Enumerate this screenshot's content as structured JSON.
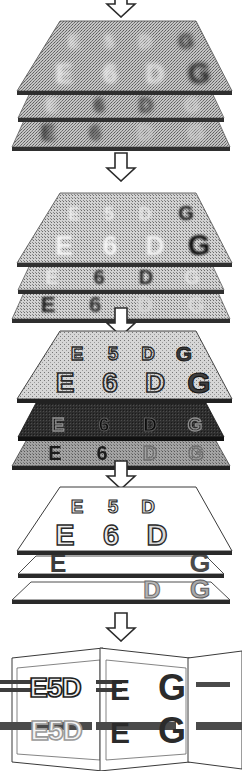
{
  "figure": {
    "type": "diagram",
    "width": 242,
    "height": 771,
    "background": "#ffffff",
    "stages": [
      {
        "id": "stage-1",
        "name": "noisy-stack",
        "order": 1,
        "description": "Three stacked horizontal planes, heavily noisy/dithered mid-gray, characters barely visible",
        "plane_fill": "#b9b9b9",
        "plane_edge": "#555555",
        "noise": "heavy",
        "sheets": [
          {
            "name": "sheet-top",
            "fill": "#b5b5b5",
            "characters_row_small": [
              "E",
              "5",
              "D",
              "G"
            ],
            "characters_row_large": [
              "E",
              "6",
              "D",
              "G"
            ]
          },
          {
            "name": "sheet-middle",
            "fill": "#b5b5b5",
            "characters_row_small": [
              "E",
              "5",
              "D",
              "G"
            ],
            "characters_row_large": [
              "E",
              "6",
              "D",
              "G"
            ]
          },
          {
            "name": "sheet-bottom",
            "fill": "#b5b5b5",
            "characters_row_small": [
              "E",
              "5",
              "D",
              "G"
            ],
            "characters_row_large": [
              "E",
              "6",
              "D",
              "G"
            ]
          }
        ]
      },
      {
        "id": "stage-2",
        "name": "less-noisy-stack",
        "order": 2,
        "description": "Three stacked planes, noise reduced, characters E 5 D G / E 6 D G becoming legible",
        "plane_fill": "#c2c2c2",
        "plane_edge": "#555555",
        "noise": "medium",
        "sheets": [
          {
            "name": "sheet-top",
            "fill": "#c0c0c0",
            "characters_row_small": [
              "E",
              "5",
              "D",
              "G"
            ],
            "characters_row_large": [
              "E",
              "6",
              "D",
              "G"
            ]
          },
          {
            "name": "sheet-middle",
            "fill": "#c0c0c0",
            "characters_row_small": [
              "E",
              "5",
              "D",
              "G"
            ],
            "characters_row_large": [
              "E",
              "6",
              "D",
              "G"
            ]
          },
          {
            "name": "sheet-bottom",
            "fill": "#c0c0c0",
            "characters_row_small": [
              "E",
              "5",
              "D",
              "G"
            ],
            "characters_row_large": [
              "E",
              "6",
              "D",
              "G"
            ]
          }
        ]
      },
      {
        "id": "stage-3",
        "name": "outlined-stack",
        "order": 3,
        "description": "Three stacked planes; top plane light gray with clearly outlined E 5 D G / E 6 D G, middle plane very dark, bottom plane mid-gray",
        "plane_fill": "#c8c8c8",
        "plane_edge": "#444444",
        "noise": "light",
        "sheets": [
          {
            "name": "sheet-top",
            "fill": "#c8c8c8",
            "characters_row_small": [
              "E",
              "5",
              "D",
              "G"
            ],
            "characters_row_large": [
              "E",
              "6",
              "D",
              "G"
            ]
          },
          {
            "name": "sheet-middle",
            "fill": "#333333",
            "characters_row_small": [
              "E",
              "5",
              "D",
              "G"
            ],
            "characters_row_large": [
              "E",
              "6",
              "D",
              "G"
            ]
          },
          {
            "name": "sheet-bottom",
            "fill": "#9a9a9a",
            "characters_row_small": [
              "E",
              "5",
              "D",
              "G"
            ],
            "characters_row_large": [
              "E",
              "6",
              "D",
              "G"
            ]
          }
        ]
      },
      {
        "id": "stage-4",
        "name": "clean-stack",
        "order": 4,
        "description": "Three stacked white planes; top holds clean E 5 D and E 6 D, lower sheets hold E ... G and D G",
        "plane_fill": "#ffffff",
        "plane_edge": "#333333",
        "noise": "none",
        "sheets": [
          {
            "name": "sheet-top",
            "fill": "#ffffff",
            "characters_row_small": [
              "E",
              "5",
              "D"
            ],
            "characters_row_large": [
              "E",
              "6",
              "D"
            ]
          },
          {
            "name": "sheet-middle",
            "fill": "#ffffff",
            "characters_row_small": [
              "E",
              "G"
            ],
            "characters_row_large": [
              "E",
              "G"
            ]
          },
          {
            "name": "sheet-bottom",
            "fill": "#ffffff",
            "characters_row_small": [
              "D",
              "G"
            ],
            "characters_row_large": [
              "D",
              "G"
            ]
          }
        ]
      },
      {
        "id": "stage-5",
        "name": "perspective-planes",
        "order": 5,
        "description": "Three vertical planes seen in perspective, each carrying characters pierced by horizontal bars",
        "plane_fill": "#ffffff",
        "plane_edge": "#333333",
        "bar_color": "#4a4a4a",
        "panes": [
          {
            "name": "pane-left",
            "characters_upper": "E5D",
            "characters_lower": "E5D",
            "upper_style": "outlined",
            "lower_style": "light-outlined"
          },
          {
            "name": "pane-middle",
            "characters_upper": "E",
            "characters_lower": "E",
            "upper_style": "solid-dark",
            "lower_style": "solid-dark"
          },
          {
            "name": "pane-right",
            "characters_upper": "G",
            "characters_lower": "G",
            "upper_style": "solid-dark",
            "lower_style": "solid-dark"
          }
        ]
      }
    ],
    "arrows": [
      {
        "name": "arrow-1",
        "direction": "down",
        "style": "hollow-outline",
        "between": [
          "top-of-figure",
          "stage-1"
        ]
      },
      {
        "name": "arrow-2",
        "direction": "down",
        "style": "hollow-outline",
        "between": [
          "stage-1",
          "stage-2"
        ]
      },
      {
        "name": "arrow-3",
        "direction": "down",
        "style": "hollow-outline",
        "between": [
          "stage-2",
          "stage-3"
        ]
      },
      {
        "name": "arrow-4",
        "direction": "down",
        "style": "hollow-outline",
        "between": [
          "stage-3",
          "stage-4"
        ]
      },
      {
        "name": "arrow-5",
        "direction": "down",
        "style": "hollow-outline",
        "between": [
          "stage-4",
          "stage-5"
        ]
      }
    ],
    "characters": {
      "row_small": [
        "E",
        "5",
        "D",
        "G"
      ],
      "row_large": [
        "E",
        "6",
        "D",
        "G"
      ]
    },
    "colors": {
      "ink": "#1a1a1a",
      "edge": "#4a4a4a",
      "light_gray": "#d0d0d0",
      "mid_gray": "#a8a8a8",
      "dark_gray": "#333333",
      "bar": "#4a4a4a",
      "white": "#ffffff"
    }
  }
}
